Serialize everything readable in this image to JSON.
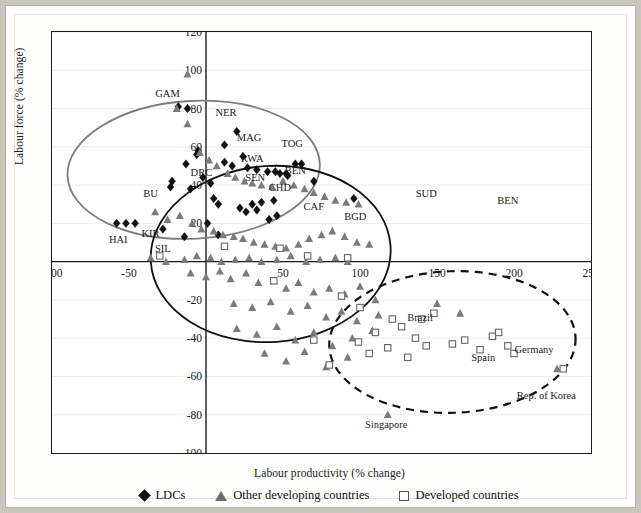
{
  "figure": {
    "background_color": "#c9c6bd",
    "plot_background": "#ffffff"
  },
  "chart_data": {
    "type": "scatter",
    "title": "",
    "xlabel": "Labour productivity (% change)",
    "ylabel": "Labour force (% change)",
    "xlim": [
      -100,
      250
    ],
    "ylim": [
      -100,
      120
    ],
    "xticks": [
      -100,
      -50,
      0,
      50,
      100,
      150,
      200,
      250
    ],
    "yticks": [
      -100,
      -80,
      -60,
      -40,
      -20,
      20,
      40,
      60,
      80,
      100,
      120
    ],
    "xtick_labels": [
      "-100",
      "-50",
      "0",
      "50",
      "100",
      "150",
      "200",
      "250"
    ],
    "ytick_labels": [
      "-100",
      "-80",
      "-60",
      "-40",
      "-20",
      "20",
      "40",
      "60",
      "80",
      "100",
      "120"
    ],
    "grid": "horizontal-light",
    "legend_position": "bottom-center",
    "series": [
      {
        "name": "LDCs",
        "marker": "diamond",
        "color": "#111111",
        "points": [
          [
            -12,
            80
          ],
          [
            -18,
            81
          ],
          [
            -5,
            58
          ],
          [
            -6,
            56
          ],
          [
            -13,
            51
          ],
          [
            -22,
            42
          ],
          [
            -23,
            39
          ],
          [
            -10,
            38
          ],
          [
            -2,
            44
          ],
          [
            3,
            41
          ],
          [
            12,
            61
          ],
          [
            20,
            68
          ],
          [
            24,
            55
          ],
          [
            27,
            49
          ],
          [
            33,
            48
          ],
          [
            40,
            47
          ],
          [
            45,
            47
          ],
          [
            48,
            46
          ],
          [
            52,
            46
          ],
          [
            53,
            45
          ],
          [
            58,
            51
          ],
          [
            62,
            51
          ],
          [
            30,
            30
          ],
          [
            33,
            27
          ],
          [
            41,
            22
          ],
          [
            46,
            24
          ],
          [
            26,
            26
          ],
          [
            22,
            28
          ],
          [
            -58,
            20
          ],
          [
            -52,
            20
          ],
          [
            -46,
            20
          ],
          [
            12,
            52
          ],
          [
            17,
            50
          ],
          [
            70,
            42
          ],
          [
            96,
            33
          ],
          [
            5,
            33
          ],
          [
            8,
            30
          ],
          [
            36,
            31
          ],
          [
            44,
            32
          ],
          [
            1,
            20
          ],
          [
            -28,
            17
          ],
          [
            -14,
            13
          ],
          [
            8,
            14
          ]
        ]
      },
      {
        "name": "Other developing countries",
        "marker": "triangle",
        "color": "#7b7b7b",
        "points": [
          [
            -12,
            98
          ],
          [
            -12,
            72
          ],
          [
            -19,
            80
          ],
          [
            -4,
            57
          ],
          [
            2,
            53
          ],
          [
            7,
            50
          ],
          [
            14,
            46
          ],
          [
            19,
            44
          ],
          [
            25,
            42
          ],
          [
            30,
            41
          ],
          [
            36,
            40
          ],
          [
            43,
            39
          ],
          [
            50,
            42
          ],
          [
            57,
            40
          ],
          [
            64,
            38
          ],
          [
            70,
            36
          ],
          [
            77,
            34
          ],
          [
            84,
            32
          ],
          [
            91,
            31
          ],
          [
            99,
            30
          ],
          [
            -33,
            26
          ],
          [
            -25,
            22
          ],
          [
            -17,
            24
          ],
          [
            -9,
            20
          ],
          [
            -3,
            17
          ],
          [
            5,
            16
          ],
          [
            11,
            14
          ],
          [
            18,
            13
          ],
          [
            24,
            12
          ],
          [
            31,
            10
          ],
          [
            38,
            9
          ],
          [
            45,
            8
          ],
          [
            52,
            7
          ],
          [
            60,
            9
          ],
          [
            67,
            12
          ],
          [
            75,
            14
          ],
          [
            82,
            16
          ],
          [
            90,
            13
          ],
          [
            98,
            10
          ],
          [
            106,
            9
          ],
          [
            -36,
            2
          ],
          [
            -26,
            0
          ],
          [
            -14,
            1
          ],
          [
            -6,
            3
          ],
          [
            3,
            2
          ],
          [
            10,
            0
          ],
          [
            19,
            1
          ],
          [
            28,
            2
          ],
          [
            36,
            0
          ],
          [
            46,
            1
          ],
          [
            55,
            3
          ],
          [
            65,
            0
          ],
          [
            74,
            1
          ],
          [
            84,
            2
          ],
          [
            92,
            0
          ],
          [
            -10,
            -6
          ],
          [
            0,
            -8
          ],
          [
            9,
            -5
          ],
          [
            16,
            -9
          ],
          [
            26,
            -6
          ],
          [
            34,
            -11
          ],
          [
            44,
            -10
          ],
          [
            52,
            -14
          ],
          [
            60,
            -11
          ],
          [
            70,
            -16
          ],
          [
            80,
            -14
          ],
          [
            90,
            -17
          ],
          [
            100,
            -13
          ],
          [
            110,
            -20
          ],
          [
            18,
            -22
          ],
          [
            30,
            -24
          ],
          [
            42,
            -21
          ],
          [
            55,
            -26
          ],
          [
            66,
            -23
          ],
          [
            78,
            -29
          ],
          [
            88,
            -26
          ],
          [
            98,
            -31
          ],
          [
            112,
            -28
          ],
          [
            20,
            -35
          ],
          [
            33,
            -38
          ],
          [
            46,
            -34
          ],
          [
            58,
            -41
          ],
          [
            70,
            -37
          ],
          [
            82,
            -44
          ],
          [
            95,
            -40
          ],
          [
            108,
            -36
          ],
          [
            38,
            -48
          ],
          [
            52,
            -52
          ],
          [
            64,
            -47
          ],
          [
            78,
            -55
          ],
          [
            92,
            -50
          ],
          [
            150,
            -22
          ],
          [
            165,
            -27
          ],
          [
            228,
            -56
          ],
          [
            118,
            -80
          ]
        ]
      },
      {
        "name": "Developed countries",
        "marker": "square",
        "color": "#666666",
        "points": [
          [
            -30,
            3
          ],
          [
            12,
            8
          ],
          [
            48,
            7
          ],
          [
            66,
            3
          ],
          [
            92,
            2
          ],
          [
            44,
            -10
          ],
          [
            88,
            -18
          ],
          [
            100,
            -24
          ],
          [
            121,
            -30
          ],
          [
            110,
            -37
          ],
          [
            127,
            -34
          ],
          [
            136,
            -40
          ],
          [
            99,
            -42
          ],
          [
            118,
            -45
          ],
          [
            143,
            -44
          ],
          [
            148,
            -27
          ],
          [
            140,
            -30
          ],
          [
            106,
            -48
          ],
          [
            131,
            -50
          ],
          [
            160,
            -43
          ],
          [
            168,
            -41
          ],
          [
            186,
            -39
          ],
          [
            190,
            -37
          ],
          [
            196,
            -44
          ],
          [
            200,
            -48
          ],
          [
            178,
            -46
          ],
          [
            232,
            -56
          ],
          [
            80,
            -54
          ],
          [
            70,
            -41
          ]
        ]
      }
    ],
    "country_labels": [
      {
        "text": "GAM",
        "x": -25,
        "y": 86
      },
      {
        "text": "NER",
        "x": 13,
        "y": 76
      },
      {
        "text": "MAG",
        "x": 28,
        "y": 63
      },
      {
        "text": "TOG",
        "x": 56,
        "y": 60
      },
      {
        "text": "RWA",
        "x": 30,
        "y": 52
      },
      {
        "text": "DRC",
        "x": -3,
        "y": 45
      },
      {
        "text": "SEN",
        "x": 32,
        "y": 42
      },
      {
        "text": "BEN",
        "x": 58,
        "y": 46
      },
      {
        "text": "CHD",
        "x": 48,
        "y": 37
      },
      {
        "text": "CAF",
        "x": 70,
        "y": 27
      },
      {
        "text": "BU",
        "x": -36,
        "y": 34
      },
      {
        "text": "BGD",
        "x": 97,
        "y": 22
      },
      {
        "text": "HAI",
        "x": -57,
        "y": 10
      },
      {
        "text": "KIR",
        "x": -36,
        "y": 13
      },
      {
        "text": "SIL",
        "x": -28,
        "y": 5
      },
      {
        "text": "SUD",
        "x": 143,
        "y": 34
      },
      {
        "text": "BEN",
        "x": 196,
        "y": 30
      },
      {
        "text": "Brazil",
        "x": 139,
        "y": -31
      },
      {
        "text": "Spain",
        "x": 180,
        "y": -52
      },
      {
        "text": "Germany",
        "x": 213,
        "y": -48
      },
      {
        "text": "Rep. of Korea",
        "x": 221,
        "y": -72
      },
      {
        "text": "Singapore",
        "x": 117,
        "y": -87
      }
    ],
    "annotations_ellipses": [
      {
        "name": "grey-solid-ellipse",
        "cx": -8,
        "cy": 48,
        "rx": 82,
        "ry": 36,
        "rot": -3,
        "style": "solid",
        "color": "#7d7d7d"
      },
      {
        "name": "black-solid-ellipse",
        "cx": 42,
        "cy": 4,
        "rx": 78,
        "ry": 46,
        "rot": -4,
        "style": "solid",
        "color": "#111111"
      },
      {
        "name": "black-dashed-ellipse",
        "cx": 160,
        "cy": -42,
        "rx": 80,
        "ry": 37,
        "rot": -2,
        "style": "dashed",
        "color": "#111111"
      }
    ]
  },
  "legend": {
    "items": [
      {
        "label": "LDCs",
        "marker": "diamond-icon"
      },
      {
        "label": "Other developing countries",
        "marker": "triangle-icon"
      },
      {
        "label": "Developed countries",
        "marker": "square-icon"
      }
    ]
  }
}
